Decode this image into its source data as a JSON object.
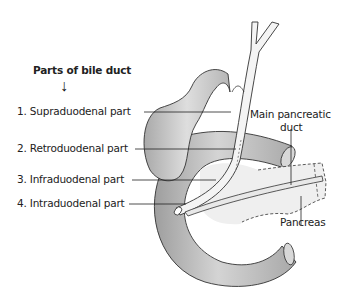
{
  "figure": {
    "title": "Parts of bile duct",
    "arrow_icon": "↓",
    "parts": [
      {
        "label": "1. Supraduodenal part"
      },
      {
        "label": "2. Retroduodenal part"
      },
      {
        "label": "3. Infraduodenal part"
      },
      {
        "label": "4. Intraduodenal part"
      }
    ],
    "right_labels": {
      "main_pancreatic_duct_line1": "Main pancreatic",
      "main_pancreatic_duct_line2": "duct",
      "pancreas": "Pancreas"
    },
    "colors": {
      "duodenum": "#b8b8b8",
      "gallbladder": "#c6c6c6",
      "pancreas": "#ececec",
      "duct": "#f2f2f2",
      "outline": "#333333"
    }
  }
}
